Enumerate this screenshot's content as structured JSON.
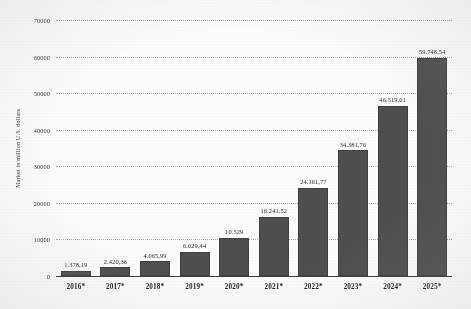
{
  "chart_data": {
    "type": "bar",
    "title": "",
    "subtitle": "",
    "xlabel": "",
    "ylabel": "Market in million U.S. dollars",
    "categories": [
      "2016*",
      "2017*",
      "2018*",
      "2019*",
      "2020*",
      "2021*",
      "2022*",
      "2023*",
      "2024*",
      "2025*"
    ],
    "values": [
      1378.19,
      2420.36,
      4065.99,
      6629.44,
      10529,
      16241.52,
      24161.77,
      34381.76,
      46519.61,
      59748.54
    ],
    "value_labels": [
      "1.378,19",
      "2.420,36",
      "4.065,99",
      "6.629,44",
      "10.529",
      "16.241,52",
      "24.161,77",
      "34.381,76",
      "46.519,61",
      "59.748,54"
    ],
    "ylim": [
      0,
      70000
    ],
    "ytick_values": [
      70000,
      60000,
      50000,
      40000,
      30000,
      20000,
      10000,
      0
    ],
    "ytick_labels": [
      "70000",
      "60000",
      "50000",
      "40000",
      "30000",
      "20000",
      "10000",
      "0"
    ],
    "grid": true,
    "grid_style": "dotted-horizontal",
    "legend": "none",
    "series_name": "Market size",
    "bar_color": "#4f4f4f",
    "background_color": "#ffffff",
    "text_color": "#2b2b2b",
    "grid_color": "#a9a9a9",
    "axis_color": "#3a3a3a"
  }
}
